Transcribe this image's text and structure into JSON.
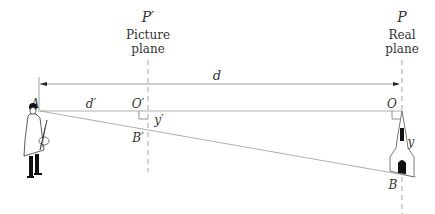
{
  "diagram": {
    "picture_plane": {
      "symbol": "P′",
      "label_line1": "Picture",
      "label_line2": "plane"
    },
    "real_plane": {
      "symbol": "P",
      "label_line1": "Real",
      "label_line2": "plane"
    },
    "points": {
      "A": "A",
      "O_prime": "O′",
      "B_prime": "B′",
      "O": "O",
      "B": "B"
    },
    "distances": {
      "d": "d",
      "d_prime": "d′",
      "y": "y",
      "y_prime": "y′"
    },
    "figures": {
      "observer": "painter-figure",
      "object": "church-tower"
    },
    "colors": {
      "line": "#888888",
      "text": "#333333",
      "ink": "#111111"
    }
  }
}
